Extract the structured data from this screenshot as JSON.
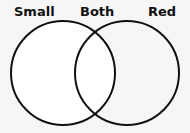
{
  "diagram": {
    "type": "venn",
    "labels": {
      "left": "Small",
      "middle": "Both",
      "right": "Red"
    },
    "circles": [
      {
        "name": "Small",
        "cx": 63,
        "cy": 73,
        "r": 52
      },
      {
        "name": "Red",
        "cx": 127,
        "cy": 73,
        "r": 52
      }
    ],
    "stroke_color": "#111111",
    "background_color": "#f6f6f6"
  }
}
